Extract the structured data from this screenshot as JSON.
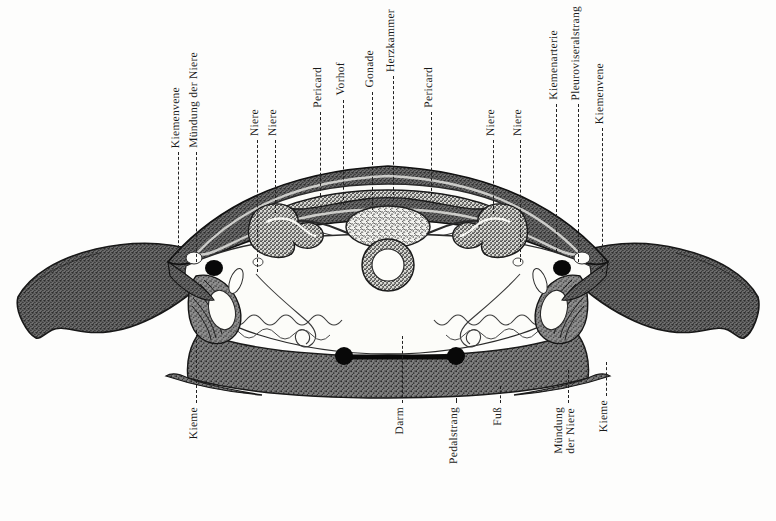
{
  "figure": {
    "kind": "anatomical-cross-section",
    "language": "German",
    "background_color": "#fdfdfc",
    "ink_color": "#1a1a1a"
  },
  "labels_top": [
    {
      "text": "Kiemenvene",
      "x": 178,
      "label_bottom": 152,
      "leader_top": 152,
      "leader_bottom": 253
    },
    {
      "text": "Mündung der Niere",
      "x": 196,
      "label_bottom": 152,
      "leader_top": 152,
      "leader_bottom": 262
    },
    {
      "text": "Niere",
      "x": 257,
      "label_bottom": 140,
      "leader_top": 140,
      "leader_bottom": 272
    },
    {
      "text": "Niere",
      "x": 275,
      "label_bottom": 140,
      "leader_top": 140,
      "leader_bottom": 213
    },
    {
      "text": "Pericard",
      "x": 320,
      "label_bottom": 112,
      "leader_top": 112,
      "leader_bottom": 196
    },
    {
      "text": "Vorhof",
      "x": 343,
      "label_bottom": 100,
      "leader_top": 100,
      "leader_bottom": 205
    },
    {
      "text": "Gonade",
      "x": 372,
      "label_bottom": 92,
      "leader_top": 92,
      "leader_bottom": 210
    },
    {
      "text": "Herzkammer",
      "x": 393,
      "label_bottom": 76,
      "leader_top": 76,
      "leader_bottom": 200
    },
    {
      "text": "Pericard",
      "x": 431,
      "label_bottom": 112,
      "leader_top": 112,
      "leader_bottom": 196
    },
    {
      "text": "Niere",
      "x": 493,
      "label_bottom": 140,
      "leader_top": 140,
      "leader_bottom": 214
    },
    {
      "text": "Niere",
      "x": 520,
      "label_bottom": 140,
      "leader_top": 140,
      "leader_bottom": 262
    },
    {
      "text": "Kiemenarterie",
      "x": 556,
      "label_bottom": 104,
      "leader_top": 104,
      "leader_bottom": 252
    },
    {
      "text": "Pleuroviseralstrang",
      "x": 578,
      "label_bottom": 104,
      "leader_top": 104,
      "leader_bottom": 262
    },
    {
      "text": "Kiemenvene",
      "x": 602,
      "label_bottom": 128,
      "leader_top": 128,
      "leader_bottom": 272
    }
  ],
  "labels_bottom": [
    {
      "text": "Kieme",
      "x": 196,
      "label_top": 407,
      "leader_top": 330,
      "leader_bottom": 403
    },
    {
      "text": "Darm",
      "x": 402,
      "label_top": 407,
      "leader_top": 336,
      "leader_bottom": 403
    },
    {
      "text": "Pedalstrang",
      "x": 456,
      "label_top": 407,
      "leader_top": 398,
      "leader_bottom": 403
    },
    {
      "text": "Fuß",
      "x": 500,
      "label_top": 407,
      "leader_top": 386,
      "leader_bottom": 403
    },
    {
      "text": "Mündung der Niere",
      "x": 568,
      "label_top": 407,
      "leader_top": 370,
      "leader_bottom": 403,
      "two_line": true,
      "line1": "Mündung",
      "line2": "der Niere"
    },
    {
      "text": "Kieme",
      "x": 606,
      "label_top": 400,
      "leader_top": 362,
      "leader_bottom": 396
    }
  ],
  "anatomy_parts": [
    "shell-left-wing",
    "shell-right-wing",
    "mantle",
    "pericard",
    "vorhof",
    "herzkammer",
    "gonade",
    "niere-left",
    "niere-right",
    "darm",
    "fuss",
    "pedalstrang",
    "kieme-left",
    "kieme-right",
    "kiemenvene-left",
    "kiemenvene-right",
    "kiemenarterie",
    "pleuroviseralstrang"
  ],
  "caption": {
    "text": "",
    "visible": false
  }
}
